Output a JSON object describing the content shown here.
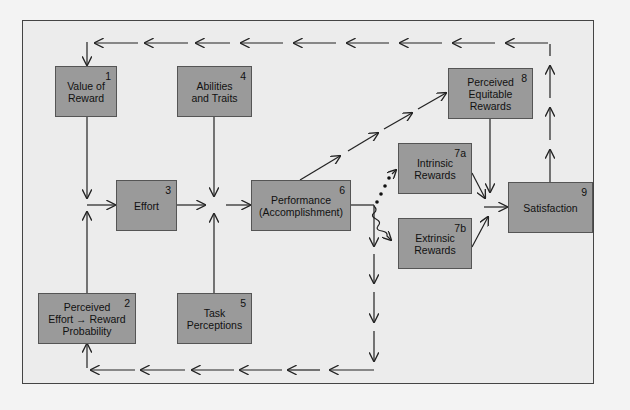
{
  "diagram": {
    "type": "flowchart",
    "colors": {
      "box_fill": "#9a9a9a",
      "box_border": "#555555",
      "frame_bg": "#ececec",
      "line": "#222222"
    },
    "nodes": [
      {
        "id": "1",
        "number": "1",
        "label": "Value of\nReward"
      },
      {
        "id": "2",
        "number": "2",
        "label": "Perceived\nEffort → Reward\nProbability"
      },
      {
        "id": "3",
        "number": "3",
        "label": "Effort"
      },
      {
        "id": "4",
        "number": "4",
        "label": "Abilities\nand Traits"
      },
      {
        "id": "5",
        "number": "5",
        "label": "Task\nPerceptions"
      },
      {
        "id": "6",
        "number": "6",
        "label": "Performance\n(Accomplishment)"
      },
      {
        "id": "7a",
        "number": "7a",
        "label": "Intrinsic\nRewards"
      },
      {
        "id": "7b",
        "number": "7b",
        "label": "Extrinsic\nRewards"
      },
      {
        "id": "8",
        "number": "8",
        "label": "Perceived\nEquitable\nRewards"
      },
      {
        "id": "9",
        "number": "9",
        "label": "Satisfaction"
      }
    ],
    "edges": [
      {
        "from": "1",
        "to": "3",
        "style": "solid"
      },
      {
        "from": "2",
        "to": "3",
        "style": "solid"
      },
      {
        "from": "3",
        "to": "6",
        "style": "solid",
        "via": "junction"
      },
      {
        "from": "4",
        "to": "6",
        "style": "solid",
        "via": "junction"
      },
      {
        "from": "5",
        "to": "6",
        "style": "solid",
        "via": "junction"
      },
      {
        "from": "6",
        "to": "8",
        "style": "dashed"
      },
      {
        "from": "6",
        "to": "7a",
        "style": "dotted"
      },
      {
        "from": "6",
        "to": "7b",
        "style": "wavy"
      },
      {
        "from": "7a",
        "to": "9",
        "style": "solid"
      },
      {
        "from": "7b",
        "to": "9",
        "style": "solid"
      },
      {
        "from": "8",
        "to": "9",
        "style": "solid"
      },
      {
        "from": "9",
        "to": "1",
        "style": "dashed",
        "note": "feedback loop across top"
      },
      {
        "from": "6",
        "to": "2",
        "style": "dashed",
        "note": "feedback loop across bottom"
      }
    ]
  }
}
